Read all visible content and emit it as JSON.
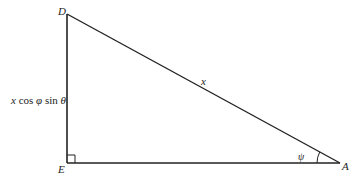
{
  "diagram": {
    "type": "right-triangle",
    "vertices": {
      "D": {
        "label": "D",
        "x": 67,
        "y": 14
      },
      "E": {
        "label": "E",
        "x": 67,
        "y": 163
      },
      "A": {
        "label": "A",
        "x": 340,
        "y": 163
      }
    },
    "sides": {
      "DA": {
        "label": "x"
      },
      "DE": {
        "label_parts": [
          "x",
          " cos ",
          "φ",
          " sin ",
          "θ"
        ]
      }
    },
    "angles": {
      "A": {
        "label": "ψ"
      },
      "E": {
        "marker": "right-angle"
      }
    },
    "colors": {
      "stroke": "#222222",
      "background": "#ffffff"
    }
  }
}
